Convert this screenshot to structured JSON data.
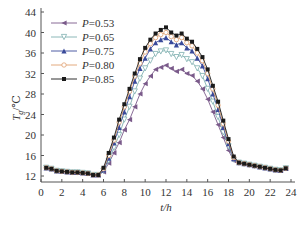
{
  "chart_data": {
    "type": "line",
    "title": "",
    "xlabel": "t/h",
    "ylabel": "Tg/°C",
    "xlim": [
      0,
      24
    ],
    "ylim": [
      10,
      44
    ],
    "xticks": [
      0,
      2,
      4,
      6,
      8,
      10,
      12,
      14,
      16,
      18,
      20,
      22,
      24
    ],
    "yticks": [
      12,
      16,
      20,
      24,
      28,
      32,
      36,
      40,
      44
    ],
    "grid": false,
    "legend_position": "upper-left",
    "x": [
      0.5,
      1,
      1.5,
      2,
      2.5,
      3,
      3.5,
      4,
      4.5,
      5,
      5.5,
      6,
      6.5,
      7,
      7.5,
      8,
      8.5,
      9,
      9.5,
      10,
      10.5,
      11,
      11.5,
      12,
      12.5,
      13,
      13.5,
      14,
      14.5,
      15,
      15.5,
      16,
      16.5,
      17,
      17.5,
      18,
      18.5,
      19,
      19.5,
      20,
      20.5,
      21,
      21.5,
      22,
      22.5,
      23,
      23.5
    ],
    "series": [
      {
        "name": "P=0.53",
        "marker": "triangle-left",
        "color": "#7a5a8a",
        "values": [
          13.6,
          13.4,
          13.0,
          12.9,
          12.8,
          12.7,
          12.7,
          12.6,
          12.5,
          12.2,
          12.2,
          12.8,
          14.5,
          16.5,
          18.5,
          21.0,
          23.0,
          25.5,
          28.0,
          30.0,
          31.5,
          32.8,
          33.2,
          33.6,
          33.0,
          32.4,
          32.8,
          32.0,
          31.6,
          30.5,
          29.0,
          27.0,
          24.5,
          22.0,
          19.5,
          17.0,
          15.0,
          14.6,
          14.4,
          14.2,
          14.0,
          13.8,
          13.6,
          13.4,
          13.2,
          13.1,
          13.5
        ]
      },
      {
        "name": "P=0.65",
        "marker": "triangle-down-open",
        "color": "#7fb0b0",
        "values": [
          13.6,
          13.4,
          13.0,
          12.9,
          12.8,
          12.7,
          12.7,
          12.6,
          12.5,
          12.2,
          12.2,
          13.0,
          15.0,
          17.5,
          20.0,
          23.0,
          25.5,
          28.5,
          31.0,
          33.0,
          34.5,
          35.8,
          36.3,
          36.5,
          35.8,
          35.2,
          35.6,
          34.8,
          34.2,
          33.0,
          31.5,
          29.0,
          26.5,
          23.5,
          20.5,
          17.8,
          15.2,
          14.6,
          14.4,
          14.2,
          14.0,
          13.8,
          13.6,
          13.4,
          13.2,
          13.1,
          13.5
        ]
      },
      {
        "name": "P=0.75",
        "marker": "triangle-up",
        "color": "#3a4a9a",
        "values": [
          13.6,
          13.4,
          13.0,
          12.9,
          12.8,
          12.7,
          12.7,
          12.6,
          12.5,
          12.2,
          12.2,
          13.2,
          15.5,
          18.5,
          21.5,
          24.5,
          27.5,
          30.5,
          33.0,
          35.0,
          36.8,
          38.0,
          38.6,
          39.0,
          38.2,
          37.6,
          38.0,
          37.0,
          36.4,
          35.0,
          33.5,
          31.0,
          28.0,
          25.0,
          21.5,
          18.3,
          15.4,
          14.6,
          14.4,
          14.2,
          14.0,
          13.8,
          13.6,
          13.4,
          13.2,
          13.1,
          13.5
        ]
      },
      {
        "name": "P=0.80",
        "marker": "circle-open",
        "color": "#e0a070",
        "values": [
          13.6,
          13.4,
          13.0,
          12.9,
          12.8,
          12.7,
          12.7,
          12.6,
          12.5,
          12.2,
          12.2,
          13.4,
          16.0,
          19.0,
          22.5,
          25.5,
          28.5,
          31.5,
          34.0,
          36.2,
          37.8,
          39.0,
          39.6,
          40.0,
          39.2,
          38.6,
          39.0,
          38.0,
          37.4,
          36.0,
          34.5,
          32.0,
          29.0,
          25.8,
          22.2,
          18.8,
          15.6,
          14.6,
          14.4,
          14.2,
          14.0,
          13.8,
          13.6,
          13.4,
          13.2,
          13.1,
          13.5
        ]
      },
      {
        "name": "P=0.85",
        "marker": "square",
        "color": "#1a1a1a",
        "values": [
          13.6,
          13.4,
          13.0,
          12.9,
          12.8,
          12.7,
          12.7,
          12.6,
          12.5,
          12.2,
          12.2,
          13.6,
          16.5,
          19.5,
          23.0,
          26.0,
          29.0,
          32.0,
          34.8,
          37.0,
          38.6,
          39.8,
          40.5,
          41.0,
          40.0,
          39.4,
          39.8,
          38.8,
          38.2,
          36.8,
          35.2,
          32.8,
          29.6,
          26.5,
          22.8,
          19.2,
          15.8,
          14.6,
          14.4,
          14.2,
          14.0,
          13.8,
          13.6,
          13.4,
          13.2,
          13.1,
          13.5
        ]
      }
    ]
  },
  "labels": {
    "xlabel": "t/h",
    "ylabel_main": "T",
    "ylabel_sub": "g",
    "ylabel_unit": "/℃",
    "legend_prefix": "P",
    "legend_values": [
      "=0.53",
      "=0.65",
      "=0.75",
      "=0.80",
      "=0.85"
    ]
  }
}
